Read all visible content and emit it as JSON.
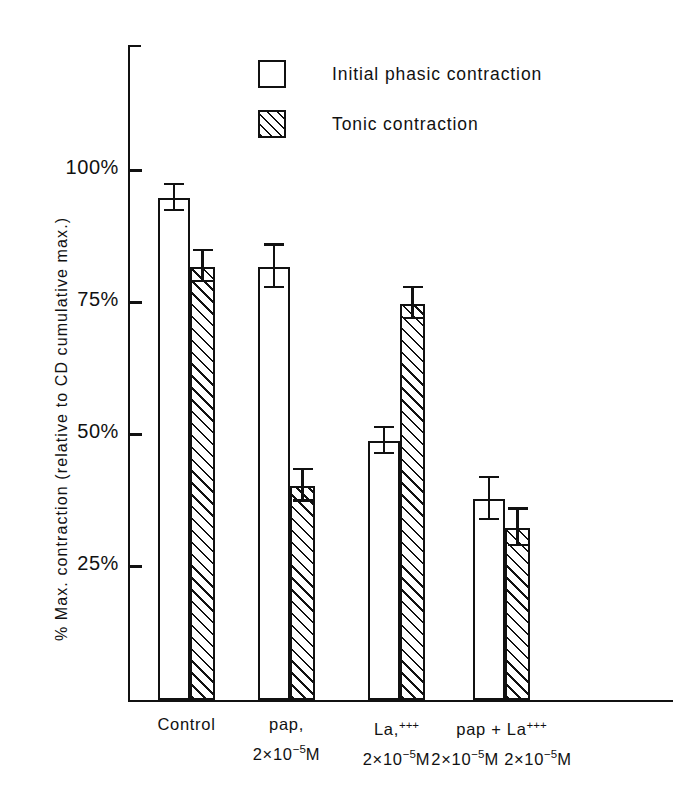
{
  "chart_data": {
    "type": "bar",
    "title": "",
    "xlabel": "",
    "ylabel": "% Max. contraction (relative to CD cumulative max.)",
    "ylim": [
      0,
      107
    ],
    "ytick_values": [
      25,
      50,
      75,
      100
    ],
    "ytick_labels": [
      "25%",
      "75%",
      "50%",
      "100%"
    ],
    "grid": false,
    "legend_position": "top-center",
    "categories": [
      "Control",
      "pap, 2×10⁻⁵M",
      "La,⁺⁺⁺ 2×10⁻⁵M",
      "pap + La⁺⁺⁺ 2×10⁻⁵M 2×10⁻⁵M"
    ],
    "series": [
      {
        "name": "Initial phasic contraction",
        "style": "open",
        "values": [
          95,
          82,
          49,
          38
        ],
        "errors": [
          2.5,
          4,
          2.5,
          4
        ]
      },
      {
        "name": "Tonic contraction",
        "style": "hatched",
        "values": [
          82,
          40.5,
          75,
          32.5
        ],
        "errors": [
          3,
          3,
          3,
          3.5
        ]
      }
    ]
  },
  "axis": {
    "ticks": [
      {
        "label": "100%",
        "value": 100
      },
      {
        "label": "75%",
        "value": 75
      },
      {
        "label": "50%",
        "value": 50
      },
      {
        "label": "25%",
        "value": 25
      }
    ],
    "ylabel": "% Max. contraction (relative to CD cumulative max.)"
  },
  "legend": {
    "items": [
      {
        "label": "Initial phasic contraction",
        "style": "open"
      },
      {
        "label": "Tonic contraction",
        "style": "hatched"
      }
    ]
  },
  "xlabels": [
    {
      "line1": "Control",
      "line2": ""
    },
    {
      "line1": "pap,",
      "line2": "2×10",
      "exp2": "−5",
      "line2b": "M"
    },
    {
      "line1": "La,",
      "exp1": "+++",
      "line2": "2×10",
      "exp2": "−5",
      "line2b": "M"
    },
    {
      "line1": "pap + La",
      "exp1": "+++",
      "line2": "2×10",
      "exp2": "−5",
      "line2b": "M 2×10",
      "exp3": "−5",
      "line2c": "M"
    }
  ],
  "colors": {
    "ink": "#111111",
    "background": "#ffffff"
  }
}
